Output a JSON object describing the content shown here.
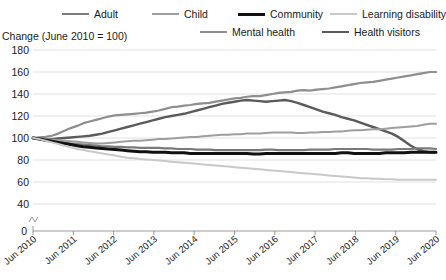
{
  "axis_caption": "Change (June 2010 = 100)",
  "footnote": "",
  "legend": {
    "items": [
      {
        "label": "Adult",
        "color": "#7a7a7a",
        "width": 2.2,
        "x": 62,
        "row": 1
      },
      {
        "label": "Child",
        "color": "#9e9e9e",
        "width": 2.0,
        "x": 152,
        "row": 1
      },
      {
        "label": "Community",
        "color": "#111111",
        "width": 3.0,
        "x": 238,
        "row": 1
      },
      {
        "label": "Learning disability",
        "color": "#c9c9c9",
        "width": 2.0,
        "x": 330,
        "row": 1
      },
      {
        "label": "Mental health",
        "color": "#8e8e8e",
        "width": 2.2,
        "x": 200,
        "row": 2
      },
      {
        "label": "Health visitors",
        "color": "#5a5a5a",
        "width": 2.4,
        "x": 322,
        "row": 2
      }
    ]
  },
  "chart_data": {
    "type": "line",
    "title": "",
    "subtitle": "",
    "xlabel": "",
    "ylabel": "Change (June 2010 = 100)",
    "ylim": [
      40,
      180
    ],
    "y_axis_break_to_zero": true,
    "yticks": [
      180,
      160,
      140,
      120,
      100,
      80,
      60,
      40,
      0
    ],
    "grid": true,
    "legend_position": "top",
    "xlim": [
      "Jun 2010",
      "Jun 2020"
    ],
    "xticks": [
      "Jun 2010",
      "Jun 2011",
      "Jun 2012",
      "Jun 2013",
      "Jun 2014",
      "Jun 2015",
      "Jun 2016",
      "Jun 2017",
      "Jun 2018",
      "Jun 2019",
      "Jun 2020"
    ],
    "x_step_months": 3,
    "series": [
      {
        "name": "Mental health",
        "color": "#8e8e8e",
        "width": 2.2,
        "values": [
          100,
          100.5,
          101,
          102,
          104,
          106.5,
          109,
          111,
          113.5,
          115,
          116.5,
          118,
          119.5,
          120.5,
          121,
          121.5,
          122,
          122.5,
          123,
          124,
          125,
          126.5,
          128,
          128.5,
          129.5,
          130,
          131,
          131.5,
          132,
          133,
          134,
          135,
          136,
          136.5,
          137.5,
          138,
          138,
          139,
          140,
          141,
          141.5,
          142,
          143,
          143.5,
          143,
          144,
          144.5,
          145,
          146,
          147,
          148,
          149,
          150,
          150.5,
          151,
          152,
          153,
          154,
          155,
          156,
          157,
          158,
          159,
          160,
          160
        ]
      },
      {
        "name": "Health visitors",
        "color": "#5a5a5a",
        "width": 2.4,
        "values": [
          100,
          99.5,
          99,
          99,
          99.5,
          100,
          100.5,
          101,
          101.5,
          102,
          103,
          104,
          105.5,
          107,
          108.5,
          110,
          111.5,
          113,
          114.5,
          116,
          117.5,
          119,
          120,
          121,
          122,
          123.5,
          125,
          126.5,
          128,
          129.5,
          131,
          132,
          133,
          134,
          134.5,
          134,
          133.5,
          133,
          133.5,
          134,
          134.5,
          133.5,
          132,
          130,
          128,
          126,
          124,
          122.5,
          121,
          119,
          117.5,
          116,
          114,
          112,
          110,
          108,
          106,
          104,
          101,
          97,
          93,
          90,
          88,
          87,
          87
        ]
      },
      {
        "name": "Child",
        "color": "#9e9e9e",
        "width": 2.0,
        "values": [
          100,
          99.5,
          99,
          98.5,
          98,
          97.5,
          97,
          96.5,
          96,
          95.5,
          95,
          95,
          95.5,
          96,
          96.5,
          97,
          97.5,
          97.5,
          98,
          98.5,
          99,
          99,
          99.5,
          100,
          100.5,
          101,
          101,
          101.5,
          102,
          102.5,
          103,
          103,
          103.5,
          103.5,
          104,
          104,
          104,
          104.5,
          105,
          105,
          105,
          105,
          104.5,
          104.5,
          105,
          105,
          105.5,
          105.5,
          106,
          106,
          106.5,
          107,
          107,
          107.5,
          108,
          108,
          108.5,
          109,
          109.5,
          110,
          110.5,
          111,
          112,
          113,
          113
        ]
      },
      {
        "name": "Adult",
        "color": "#7a7a7a",
        "width": 2.2,
        "values": [
          100,
          99,
          98,
          97,
          96,
          95.5,
          95,
          94.5,
          94,
          93.5,
          93,
          92.5,
          92.5,
          92,
          92,
          91.5,
          91.5,
          91,
          91,
          91,
          91,
          90.5,
          90.5,
          90,
          90,
          90,
          89.5,
          89.5,
          89.5,
          89,
          89,
          89,
          89,
          89,
          89,
          89,
          89,
          89.5,
          89.5,
          89,
          89,
          89,
          89,
          89,
          89.5,
          89.5,
          89.5,
          89.5,
          90,
          90,
          90,
          90,
          90,
          90,
          89.5,
          89.5,
          89.5,
          89.5,
          90,
          90,
          90,
          90.5,
          90.5,
          90.5,
          90
        ]
      },
      {
        "name": "Community",
        "color": "#111111",
        "width": 3.0,
        "values": [
          100,
          99,
          98,
          97,
          96,
          95,
          94,
          93,
          92,
          91.5,
          91,
          90.5,
          90,
          89.5,
          89,
          88.5,
          88,
          87.5,
          87.5,
          87,
          87,
          87,
          86.5,
          86.5,
          86.5,
          86,
          86,
          86,
          86,
          86,
          86,
          86,
          86,
          86,
          86,
          85.5,
          85.5,
          86,
          86,
          86,
          86,
          86,
          86,
          86,
          86,
          86,
          86,
          86,
          86,
          86.5,
          86.5,
          86,
          86,
          86,
          86,
          86,
          86.5,
          86.5,
          86.5,
          86.5,
          87,
          87,
          87,
          87,
          87
        ]
      },
      {
        "name": "Learning disability",
        "color": "#c9c9c9",
        "width": 2.0,
        "values": [
          100,
          99,
          97.5,
          96,
          94.5,
          93,
          91.5,
          90,
          89,
          88,
          87,
          86,
          85,
          84,
          83,
          82,
          81.5,
          81,
          80.5,
          80,
          79.5,
          79,
          78.5,
          78,
          77.5,
          77,
          76.5,
          76,
          75.5,
          75,
          74.5,
          74,
          73.5,
          73,
          72.5,
          72,
          71.5,
          71,
          70.5,
          70,
          69.5,
          69,
          68.5,
          68,
          67.5,
          67,
          66.5,
          66,
          65.5,
          65,
          64.5,
          64,
          63.5,
          63.5,
          63,
          63,
          62.5,
          62.5,
          62,
          62,
          62,
          62,
          62,
          62,
          62
        ]
      }
    ]
  }
}
